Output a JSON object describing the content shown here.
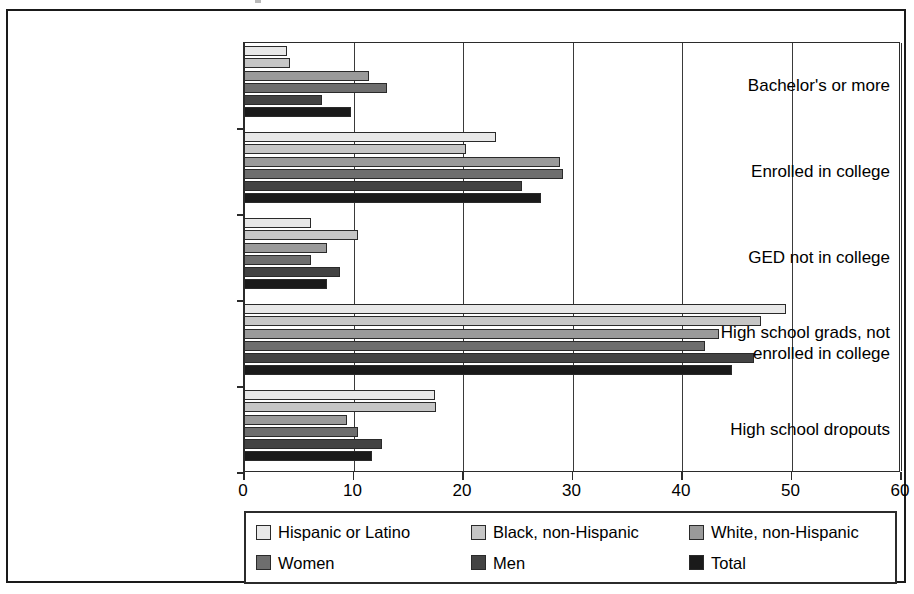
{
  "figure": {
    "scan_mark": "scan-artifact"
  },
  "chart_data": {
    "type": "bar",
    "orientation": "horizontal",
    "title": "",
    "subtitle": "",
    "xlabel": "",
    "ylabel": "",
    "xlim": [
      0,
      60
    ],
    "xticks": [
      0,
      10,
      20,
      30,
      40,
      50,
      60
    ],
    "xtick_labels": [
      "0",
      "10",
      "20",
      "30",
      "40",
      "50",
      "60"
    ],
    "grid": "vertical",
    "legend_position": "bottom",
    "categories": [
      "Bachelor's or more",
      "Enrolled in college",
      "GED not in college",
      "High school grads, not enrolled in college",
      "High school dropouts"
    ],
    "category_label_lines": [
      [
        "Bachelor's or more"
      ],
      [
        "Enrolled in college"
      ],
      [
        "GED not in college"
      ],
      [
        "High school grads, not",
        "enrolled in college"
      ],
      [
        "High school dropouts"
      ]
    ],
    "series": [
      {
        "name": "Hispanic or Latino",
        "color": "#e8e8e8",
        "values": [
          3.9,
          23.0,
          6.1,
          49.5,
          17.4
        ]
      },
      {
        "name": "Black, non-Hispanic",
        "color": "#c6c6c6",
        "values": [
          4.2,
          20.3,
          10.4,
          47.2,
          17.5
        ]
      },
      {
        "name": "White, non-Hispanic",
        "color": "#9a9a9a",
        "values": [
          11.4,
          28.9,
          7.6,
          43.4,
          9.4
        ]
      },
      {
        "name": "Women",
        "color": "#6e6e6e",
        "values": [
          13.1,
          29.1,
          6.1,
          42.1,
          10.4
        ]
      },
      {
        "name": "Men",
        "color": "#434343",
        "values": [
          7.1,
          25.4,
          8.8,
          46.6,
          12.6
        ]
      },
      {
        "name": "Total",
        "color": "#1a1a1a",
        "values": [
          9.8,
          27.1,
          7.6,
          44.6,
          11.7
        ]
      }
    ]
  }
}
